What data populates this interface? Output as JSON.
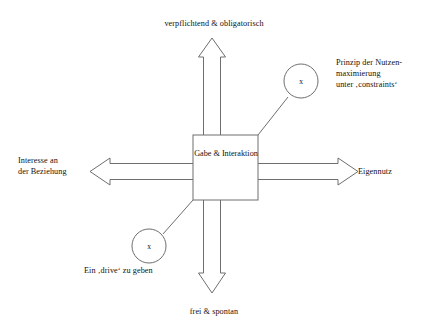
{
  "diagram": {
    "title_visible": false,
    "background_color": "#ffffff",
    "stroke_color": "#6e6e6e",
    "text_color": "#111111",
    "center_box": {
      "label_lines": [
        "Gabe",
        "&",
        "Interaktion"
      ],
      "text": "Gabe\n&\nInteraktion"
    },
    "axes": {
      "top": {
        "label": "verpflichtend & obligatorisch",
        "direction": "up"
      },
      "bottom": {
        "label": "frei & spontan",
        "direction": "down"
      },
      "left": {
        "label": "Interesse an\nder Beziehung",
        "direction": "left"
      },
      "right": {
        "label": "Eigennutz",
        "direction": "right"
      }
    },
    "nodes": [
      {
        "id": "upper-right-node",
        "marker": "x",
        "annotation": "Prinzip der Nutzen-\nmaximierung\nunter ‚contraints‘",
        "annotation_text": "Prinzip der Nutzen-\nmaximierung\nunter ‚constraints‘",
        "position": "upper-right"
      },
      {
        "id": "lower-left-node",
        "marker": "x",
        "annotation_text": "Ein ‚drive‘ zu geben",
        "position": "lower-left"
      }
    ]
  }
}
